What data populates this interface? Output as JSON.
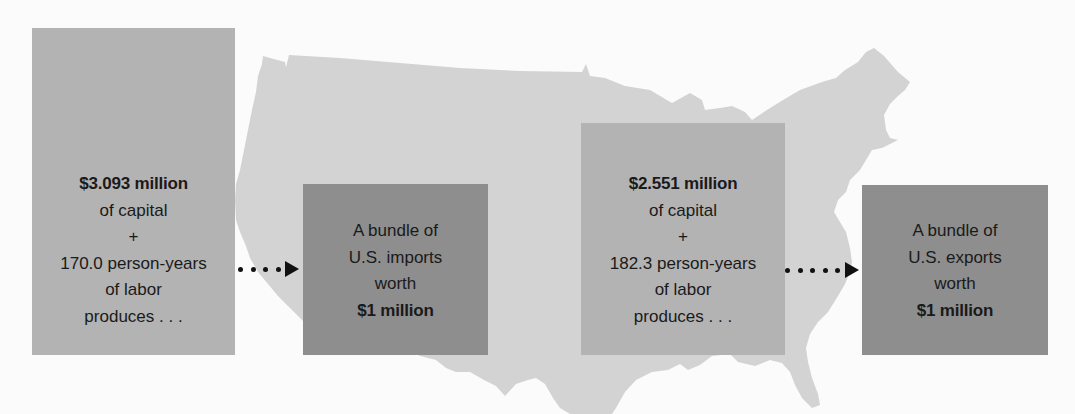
{
  "colors": {
    "map_fill": "#d3d3d3",
    "input_box": "#b3b3b3",
    "output_box": "#8e8e8e",
    "text": "#1a1a1a",
    "arrow": "#111111",
    "background": "#fbfbfb"
  },
  "imports": {
    "inputs": {
      "capital_amount": "$3.093 million",
      "capital_label": "of capital",
      "plus": "+",
      "labor_amount": "170.0 person-years",
      "labor_label": "of labor",
      "verb": "produces . . ."
    },
    "output": {
      "line1": "A bundle of",
      "line2": "U.S. imports",
      "line3": "worth",
      "value": "$1 million"
    },
    "arrow_dots": 4
  },
  "exports": {
    "inputs": {
      "capital_amount": "$2.551 million",
      "capital_label": "of capital",
      "plus": "+",
      "labor_amount": "182.3 person-years",
      "labor_label": "of labor",
      "verb": "produces . . ."
    },
    "output": {
      "line1": "A bundle of",
      "line2": "U.S. exports",
      "line3": "worth",
      "value": "$1 million"
    },
    "arrow_dots": 5
  },
  "background_icon": "us-map-silhouette"
}
